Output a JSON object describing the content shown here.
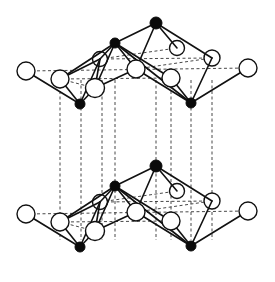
{
  "diagram": {
    "colors": {
      "background": "#ffffff",
      "bond": "#111111",
      "black_atom": "#0a0a0a",
      "white_atom_fill": "#ffffff"
    },
    "layer_offset_y": 143,
    "layers": [
      {
        "name": "top-layer",
        "dy": 0
      },
      {
        "name": "bottom-layer",
        "dy": 143
      }
    ],
    "vertical_dash_x": [
      60,
      81,
      102,
      115,
      156,
      171,
      191,
      212
    ],
    "vertical_dash_y": [
      80,
      240
    ]
  }
}
